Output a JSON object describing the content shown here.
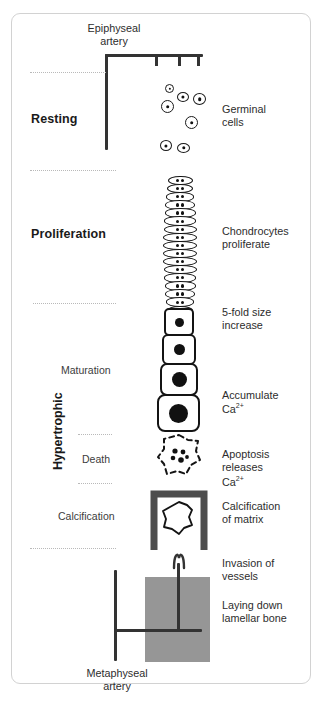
{
  "diagram": {
    "top_artery_label": "Epiphyseal\nartery",
    "bottom_artery_label": "Metaphyseal\nartery",
    "zones": [
      {
        "name": "resting",
        "label": "Resting",
        "style": "main"
      },
      {
        "name": "proliferation",
        "label": "Proliferation",
        "style": "main"
      },
      {
        "name": "maturation",
        "label": "Maturation",
        "style": "sub"
      },
      {
        "name": "death",
        "label": "Death",
        "style": "sub"
      },
      {
        "name": "calcification",
        "label": "Calcification",
        "style": "sub"
      }
    ],
    "hypertrophic_label": "Hypertrophic",
    "annotations": [
      {
        "name": "germinal-cells",
        "text": "Germinal\ncells"
      },
      {
        "name": "chondrocytes",
        "text": "Chondrocytes\nproliferate"
      },
      {
        "name": "five-fold-size",
        "text": "5-fold size\nincrease"
      },
      {
        "name": "accumulate-ca",
        "text": "Accumulate\nCa"
      },
      {
        "name": "accumulate-ca-sup",
        "text": "2+"
      },
      {
        "name": "apoptosis-releases",
        "text": "Apoptosis\nreleases\nCa"
      },
      {
        "name": "apoptosis-ca-sup",
        "text": "2+"
      },
      {
        "name": "calcification-matrix",
        "text": "Calcification\nof matrix"
      },
      {
        "name": "invasion-vessels",
        "text": "Invasion of\nvessels"
      },
      {
        "name": "laying-lamellar",
        "text": "Laying down\nlamellar bone"
      }
    ],
    "colors": {
      "ink": "#333333",
      "outline": "#141414",
      "nucleus": "#111111",
      "bone_gray": "#969696",
      "bracket_gray": "#4d4d4d",
      "frame": "#d2d2d2",
      "dash": "#b9b9b9"
    },
    "germinal_cells": [
      {
        "x": 165,
        "y": 84,
        "w": 7,
        "h": 7,
        "nw": 2.3,
        "nh": 2.3
      },
      {
        "x": 177,
        "y": 92,
        "w": 10,
        "h": 8,
        "nw": 3.2,
        "nh": 3.2
      },
      {
        "x": 193,
        "y": 93,
        "w": 11,
        "h": 10,
        "nw": 3.6,
        "nh": 3.6
      },
      {
        "x": 161,
        "y": 100,
        "w": 11,
        "h": 11,
        "nw": 3.6,
        "nh": 3.6
      },
      {
        "x": 185,
        "y": 116,
        "w": 11,
        "h": 11,
        "nw": 3.6,
        "nh": 3.6
      },
      {
        "x": 160,
        "y": 140,
        "w": 10,
        "h": 9,
        "nw": 3.2,
        "nh": 3.2
      },
      {
        "x": 177,
        "y": 143,
        "w": 11,
        "h": 8,
        "nw": 3.4,
        "nh": 3.4
      }
    ],
    "proliferation_rows": 18,
    "hypertrophic_cells": [
      {
        "w": 26,
        "h": 24,
        "nuc": 9,
        "r": 5
      },
      {
        "w": 30,
        "h": 27,
        "nuc": 11,
        "r": 6
      },
      {
        "w": 34,
        "h": 29,
        "nuc": 15,
        "r": 7
      },
      {
        "w": 39,
        "h": 34,
        "nuc": 19,
        "r": 8
      }
    ],
    "ruler_ticks": [
      3
    ]
  }
}
